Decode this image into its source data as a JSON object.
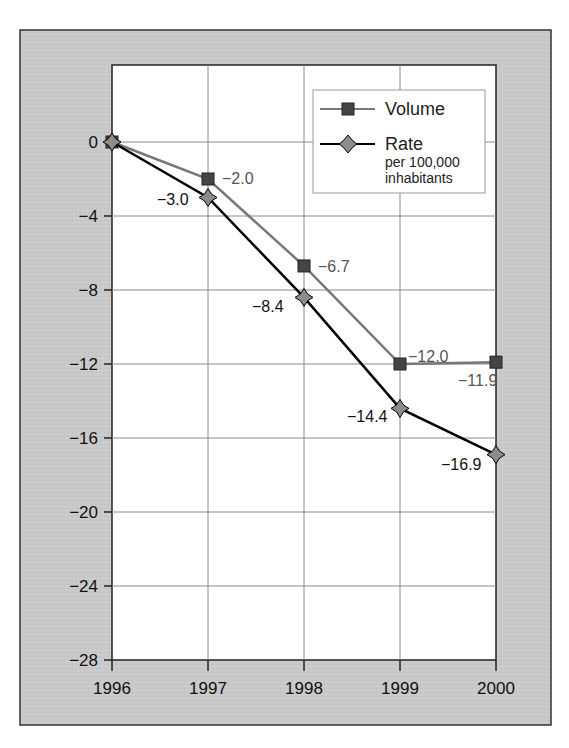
{
  "chart_data": {
    "type": "line",
    "title": "",
    "xlabel": "",
    "ylabel": "",
    "x": [
      "1996",
      "1997",
      "1998",
      "1999",
      "2000"
    ],
    "ylim": [
      -28,
      0
    ],
    "yticks": [
      0,
      -4,
      -8,
      -12,
      -16,
      -20,
      -24,
      -28
    ],
    "grid": true,
    "legend_position": "upper right",
    "series": [
      {
        "name": "Volume",
        "values": [
          0,
          -2.0,
          -6.7,
          -12.0,
          -11.9
        ],
        "labels": [
          "",
          "−2.0",
          "−6.7",
          "−12.0",
          "−11.9"
        ],
        "marker": "square",
        "color": "#777777"
      },
      {
        "name": "Rate per 100,000 inhabitants",
        "values": [
          0,
          -3.0,
          -8.4,
          -14.4,
          -16.9
        ],
        "labels": [
          "",
          "−3.0",
          "−8.4",
          "−14.4",
          "−16.9"
        ],
        "marker": "diamond",
        "color": "#000000"
      }
    ]
  },
  "axis": {
    "y_tick_labels": [
      "0",
      "−4",
      "−8",
      "−12",
      "−16",
      "−20",
      "−24",
      "−28"
    ],
    "x_tick_labels": [
      "1996",
      "1997",
      "1998",
      "1999",
      "2000"
    ]
  },
  "legend": {
    "volume_label": "Volume",
    "rate_label": "Rate",
    "rate_sub1": "per 100,000",
    "rate_sub2": "inhabitants"
  },
  "colors": {
    "panel_bg": "#c8c8c8",
    "plot_bg": "#ffffff",
    "grid": "#8a8a8a",
    "volume_line": "#777777",
    "volume_marker": "#444444",
    "rate_line": "#000000",
    "rate_marker": "#8c8c8c"
  }
}
